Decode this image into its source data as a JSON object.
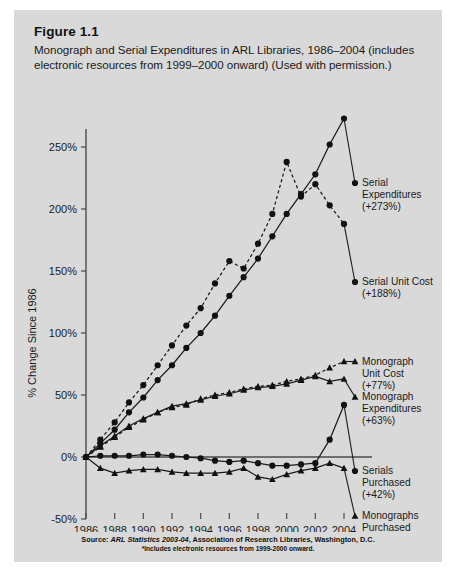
{
  "figure": {
    "number": "Figure 1.1",
    "caption": "Monograph and Serial Expenditures in ARL Libraries, 1986–2004 (includes electronic resources from 1999–2000 onward) (Used with permission.)"
  },
  "source": {
    "line1_prefix": "Source: ",
    "line1_italic": "ARL Statistics 2003-04",
    "line1_suffix": ", Association of Research Libraries, Washington, D.C.",
    "line2": "*Includes electronic resources from 1999-2000 onward."
  },
  "colors": {
    "panel_background": "#d9d9d9",
    "page_background": "#ffffff",
    "ink": "#1a1a1a",
    "axis": "#4a4a4a"
  },
  "chart_data": {
    "type": "line",
    "title": "Monograph and Serial Expenditures in ARL Libraries, 1986–2004",
    "xlabel": "",
    "ylabel": "% Change Since 1986",
    "xlim": [
      1986,
      2004
    ],
    "ylim": [
      -50,
      275
    ],
    "yticks": [
      -50,
      0,
      50,
      100,
      150,
      200,
      250
    ],
    "ytick_labels": [
      "-50%",
      "0%",
      "50%",
      "100%",
      "150%",
      "200%",
      "250%"
    ],
    "xticks": [
      1986,
      1988,
      1990,
      1992,
      1994,
      1996,
      1998,
      2000,
      2002,
      2004
    ],
    "xtick_labels": [
      "1986",
      "1988",
      "1990",
      "1992",
      "1994",
      "1996",
      "1998",
      "2000",
      "2002",
      "2004"
    ],
    "x": [
      1986,
      1987,
      1988,
      1989,
      1990,
      1991,
      1992,
      1993,
      1994,
      1995,
      1996,
      1997,
      1998,
      1999,
      2000,
      2001,
      2002,
      2003,
      2004
    ],
    "grid": false,
    "legend_position": "right-inline-labels",
    "series": [
      {
        "name": "Serial Expenditures",
        "label_line1": "Serial",
        "label_line2": "Expenditures",
        "change": "(+273%)",
        "marker": "circle",
        "style": "solid",
        "values": [
          0,
          11,
          22,
          36,
          48,
          62,
          74,
          88,
          100,
          114,
          130,
          145,
          160,
          178,
          196,
          212,
          228,
          252,
          273
        ]
      },
      {
        "name": "Serial Unit Cost",
        "label_line1": "Serial Unit Cost",
        "label_line2": "",
        "change": "(+188%)",
        "marker": "circle",
        "style": "dashed",
        "values": [
          0,
          14,
          28,
          44,
          58,
          74,
          90,
          106,
          120,
          140,
          158,
          152,
          172,
          196,
          238,
          210,
          220,
          203,
          188
        ]
      },
      {
        "name": "Monograph Unit Cost",
        "label_line1": "Monograph",
        "label_line2": "Unit Cost",
        "change": "(+77%)",
        "marker": "triangle",
        "style": "dashed",
        "values": [
          0,
          8,
          16,
          24,
          30,
          36,
          40,
          42,
          47,
          50,
          52,
          55,
          57,
          58,
          61,
          63,
          66,
          72,
          77
        ]
      },
      {
        "name": "Monograph Expenditures",
        "label_line1": "Monograph",
        "label_line2": "Expenditures",
        "change": "(+63%)",
        "marker": "triangle",
        "style": "solid",
        "values": [
          0,
          9,
          17,
          25,
          31,
          36,
          41,
          43,
          46,
          49,
          51,
          54,
          56,
          57,
          59,
          62,
          65,
          61,
          63
        ]
      },
      {
        "name": "Serials Purchased",
        "label_line1": "Serials",
        "label_line2": "Purchased",
        "change": "(+42%)",
        "marker": "circle",
        "style": "solid",
        "values": [
          0,
          1,
          1,
          1,
          2,
          2,
          1,
          0,
          -1,
          -3,
          -4,
          -3,
          -5,
          -7,
          -7,
          -6,
          -5,
          14,
          42
        ]
      },
      {
        "name": "Monographs Purchased",
        "label_line1": "Monographs",
        "label_line2": "Purchased",
        "change": "(-9%)",
        "marker": "triangle",
        "style": "solid",
        "values": [
          0,
          -9,
          -13,
          -11,
          -10,
          -10,
          -12,
          -13,
          -13,
          -13,
          -12,
          -9,
          -16,
          -18,
          -14,
          -11,
          -9,
          -5,
          -9
        ]
      }
    ]
  }
}
